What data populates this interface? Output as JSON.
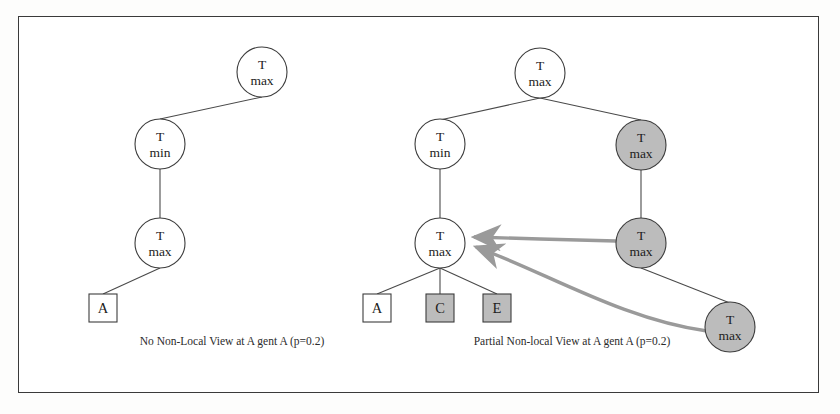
{
  "figure": {
    "frame_color": "#3a3a3a",
    "background": "#ffffff"
  },
  "colors": {
    "node_stroke": "#3c3c3c",
    "node_fill_plain": "#ffffff",
    "node_fill_shaded": "#bcbcbc",
    "edge": "#4a4a4a",
    "arrow": "#9a9a9a",
    "text": "#1c1c1c"
  },
  "panels": [
    {
      "id": "left-panel",
      "caption": "No Non-Local  View at A gent A (p=0.2)",
      "caption_x": 232,
      "caption_y": 345,
      "nodes": [
        {
          "id": "l-root",
          "name": "node-t-max-root",
          "shape": "circle",
          "cx": 262,
          "cy": 72,
          "r": 25,
          "shaded": false,
          "line1": "T",
          "line2": "max"
        },
        {
          "id": "l-min",
          "name": "node-t-min",
          "shape": "circle",
          "cx": 160,
          "cy": 144,
          "r": 25,
          "shaded": false,
          "line1": "T",
          "line2": "min"
        },
        {
          "id": "l-max2",
          "name": "node-t-max-lower",
          "shape": "circle",
          "cx": 160,
          "cy": 243,
          "r": 25,
          "shaded": false,
          "line1": "T",
          "line2": "max"
        },
        {
          "id": "l-boxA",
          "name": "box-agent-a",
          "shape": "box",
          "cx": 103,
          "cy": 308,
          "w": 28,
          "h": 28,
          "shaded": false,
          "line1": "A"
        }
      ],
      "edges": [
        {
          "name": "edge-root-to-min",
          "x1": 262,
          "y1": 97,
          "x2": 160,
          "y2": 119
        },
        {
          "name": "edge-min-to-max",
          "x1": 160,
          "y1": 169,
          "x2": 160,
          "y2": 218
        },
        {
          "name": "edge-max-to-a",
          "x1": 160,
          "y1": 268,
          "x2": 103,
          "y2": 294
        }
      ]
    },
    {
      "id": "right-panel",
      "caption": "Partial Non-local  View at A gent A (p=0.2)",
      "caption_x": 572,
      "caption_y": 345,
      "nodes": [
        {
          "id": "r-root",
          "name": "node-t-max-root",
          "shape": "circle",
          "cx": 540,
          "cy": 73,
          "r": 25,
          "shaded": false,
          "line1": "T",
          "line2": "max"
        },
        {
          "id": "r-min",
          "name": "node-t-min",
          "shape": "circle",
          "cx": 440,
          "cy": 144,
          "r": 25,
          "shaded": false,
          "line1": "T",
          "line2": "min"
        },
        {
          "id": "r-max-nl1",
          "name": "node-t-max-nonlocal-1",
          "shape": "circle",
          "cx": 641,
          "cy": 145,
          "r": 25,
          "shaded": true,
          "line1": "T",
          "line2": "max"
        },
        {
          "id": "r-max-mid",
          "name": "node-t-max-local",
          "shape": "circle",
          "cx": 440,
          "cy": 243,
          "r": 25,
          "shaded": false,
          "line1": "T",
          "line2": "max"
        },
        {
          "id": "r-max-nl2",
          "name": "node-t-max-nonlocal-2",
          "shape": "circle",
          "cx": 641,
          "cy": 243,
          "r": 25,
          "shaded": true,
          "line1": "T",
          "line2": "max"
        },
        {
          "id": "r-max-nl3",
          "name": "node-t-max-nonlocal-3",
          "shape": "circle",
          "cx": 730,
          "cy": 327,
          "r": 25,
          "shaded": true,
          "line1": "T",
          "line2": "max"
        },
        {
          "id": "r-boxA",
          "name": "box-agent-a",
          "shape": "box",
          "cx": 377,
          "cy": 308,
          "w": 28,
          "h": 28,
          "shaded": false,
          "line1": "A"
        },
        {
          "id": "r-boxC",
          "name": "box-agent-c",
          "shape": "box",
          "cx": 440,
          "cy": 308,
          "w": 28,
          "h": 28,
          "shaded": true,
          "line1": "C"
        },
        {
          "id": "r-boxE",
          "name": "box-agent-e",
          "shape": "box",
          "cx": 497,
          "cy": 308,
          "w": 28,
          "h": 28,
          "shaded": true,
          "line1": "E"
        }
      ],
      "edges": [
        {
          "name": "edge-root-to-min",
          "x1": 540,
          "y1": 98,
          "x2": 440,
          "y2": 120
        },
        {
          "name": "edge-root-to-nl1",
          "x1": 540,
          "y1": 98,
          "x2": 641,
          "y2": 120
        },
        {
          "name": "edge-min-to-maxmid",
          "x1": 440,
          "y1": 169,
          "x2": 440,
          "y2": 218
        },
        {
          "name": "edge-nl1-to-nl2",
          "x1": 641,
          "y1": 170,
          "x2": 641,
          "y2": 218
        },
        {
          "name": "edge-nl2-to-nl3",
          "x1": 641,
          "y1": 268,
          "x2": 730,
          "y2": 303
        },
        {
          "name": "edge-maxmid-to-a",
          "x1": 440,
          "y1": 268,
          "x2": 377,
          "y2": 294
        },
        {
          "name": "edge-maxmid-to-c",
          "x1": 440,
          "y1": 268,
          "x2": 440,
          "y2": 294
        },
        {
          "name": "edge-maxmid-to-e",
          "x1": 440,
          "y1": 268,
          "x2": 497,
          "y2": 294
        }
      ],
      "arrows": [
        {
          "name": "arrow-nonlocal-2-to-local",
          "path": "M 616 243 L 530 240 L 473 238",
          "tip_x": 466,
          "tip_y": 238
        },
        {
          "name": "arrow-nonlocal-3-to-local",
          "path": "M 707 332 C 620 320, 540 270, 474 246",
          "tip_x": 466,
          "tip_y": 243
        }
      ]
    }
  ]
}
